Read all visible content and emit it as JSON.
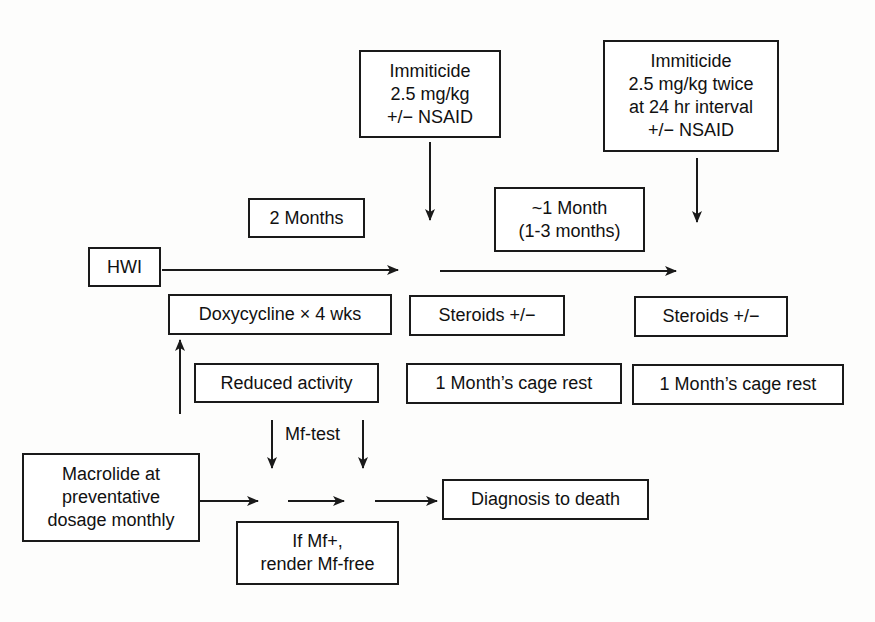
{
  "diagram": {
    "type": "treatment-timeline-flowchart",
    "nodes": {
      "immiticide_single": "Immiticide\n2.5 mg/kg\n+/− NSAID",
      "immiticide_double": "Immiticide\n2.5 mg/kg twice\nat 24 hr interval\n+/− NSAID",
      "two_months": "2 Months",
      "one_month": "~1 Month\n(1-3 months)",
      "hwi": "HWI",
      "doxycycline": "Doxycycline × 4 wks",
      "steroids_1": "Steroids +/−",
      "steroids_2": "Steroids +/−",
      "reduced_activity": "Reduced activity",
      "cage_rest_1": "1 Month’s cage rest",
      "cage_rest_2": "1 Month’s cage rest",
      "macrolide": "Macrolide at\npreventative\ndosage monthly",
      "diagnosis_to_death": "Diagnosis to death",
      "if_mf_positive": "If Mf+,\nrender Mf-free"
    },
    "labels": {
      "mf_test": "Mf-test"
    },
    "edges": [
      {
        "from": "hwi",
        "to": "timepoint_1",
        "direction": "right"
      },
      {
        "from": "timepoint_1",
        "to": "timepoint_2",
        "direction": "right"
      },
      {
        "from": "immiticide_single",
        "to": "timepoint_1",
        "direction": "down"
      },
      {
        "from": "immiticide_double",
        "to": "timepoint_2",
        "direction": "down"
      },
      {
        "from": "macrolide",
        "to": "doxycycline",
        "direction": "up"
      },
      {
        "from": "macrolide",
        "to": "diagnosis_to_death",
        "direction": "right",
        "segments": 3
      },
      {
        "from": "mf_test",
        "to": "bottom_timeline",
        "direction": "down",
        "count": 2
      }
    ],
    "colors": {
      "line": "#1a1a1a",
      "background": "#fdfdfc"
    }
  }
}
